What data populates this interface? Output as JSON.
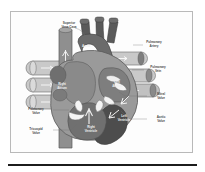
{
  "figure": {
    "frame_border_color": "#b9b9b9",
    "background_color": "#ffffff",
    "rule_color": "#1c1c1c"
  },
  "palette": {
    "vessel_light": "#c9c9c9",
    "vessel_mid": "#9a9a9a",
    "muscle_mid": "#8f8f8f",
    "muscle_dark": "#646464",
    "chamber_dark": "#555555",
    "chamber_darkest": "#3f3f3f",
    "valve_white": "#f4f4f4",
    "outline": "#5a5a5a",
    "label_dark": "#4a4a4a",
    "label_light": "#f0f0f0"
  },
  "labels": [
    {
      "id": "superior-vena-cava",
      "line1": "Superior",
      "line2": "Vena Cava",
      "x": 58,
      "y": 12,
      "tone": "dark"
    },
    {
      "id": "aorta",
      "line1": "Aorta",
      "line2": "",
      "x": 75,
      "y": 35,
      "tone": "light"
    },
    {
      "id": "pulmonary-artery",
      "line1": "Pulmonary",
      "line2": "Artery",
      "x": 143,
      "y": 31,
      "tone": "dark"
    },
    {
      "id": "pulmonary-vein",
      "line1": "Pulmonary",
      "line2": "Vein",
      "x": 147,
      "y": 56,
      "tone": "dark"
    },
    {
      "id": "mitral-valve",
      "line1": "Mitral",
      "line2": "Valve",
      "x": 150,
      "y": 83,
      "tone": "dark"
    },
    {
      "id": "aortic-valve",
      "line1": "Aortic",
      "line2": "Valve",
      "x": 150,
      "y": 106,
      "tone": "dark"
    },
    {
      "id": "right-atrium",
      "line1": "Right",
      "line2": "Atrium",
      "x": 51,
      "y": 73,
      "tone": "light"
    },
    {
      "id": "left-atrium",
      "line1": "Left",
      "line2": "Atrium",
      "x": 106,
      "y": 71,
      "tone": "light"
    },
    {
      "id": "left-ventricle",
      "line1": "Left",
      "line2": "Ventricle",
      "x": 113,
      "y": 105,
      "tone": "light"
    },
    {
      "id": "right-ventricle",
      "line1": "Right",
      "line2": "Ventricle",
      "x": 80,
      "y": 116,
      "tone": "light"
    },
    {
      "id": "pulmonary-valve",
      "line1": "Pulmonary",
      "line2": "Valve",
      "x": 25,
      "y": 98,
      "tone": "dark"
    },
    {
      "id": "tricuspid-valve",
      "line1": "Tricuspid",
      "line2": "Valve",
      "x": 25,
      "y": 118,
      "tone": "dark"
    }
  ],
  "flow_arrows": {
    "count": 9,
    "description": "white directional blood-flow arrows inside vessels and chambers"
  }
}
